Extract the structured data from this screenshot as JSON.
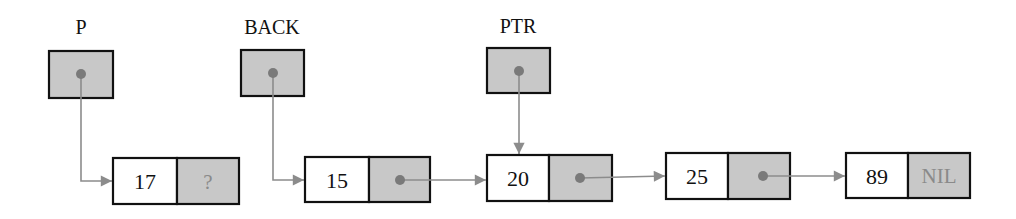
{
  "diagram": {
    "type": "linked-list",
    "colors": {
      "pointer_fill": "#c8c8c8",
      "border": "#111111",
      "arrow": "#8c8c8c",
      "nil_text": "#8a8a8a"
    },
    "pointers": [
      {
        "label": "P",
        "points_to": "node-17"
      },
      {
        "label": "BACK",
        "points_to": "node-15"
      },
      {
        "label": "PTR",
        "points_to": "node-20"
      }
    ],
    "nodes": [
      {
        "value": "17",
        "next": "?"
      },
      {
        "value": "15",
        "next": ""
      },
      {
        "value": "20",
        "next": ""
      },
      {
        "value": "25",
        "next": ""
      },
      {
        "value": "89",
        "next": "NIL"
      }
    ]
  }
}
